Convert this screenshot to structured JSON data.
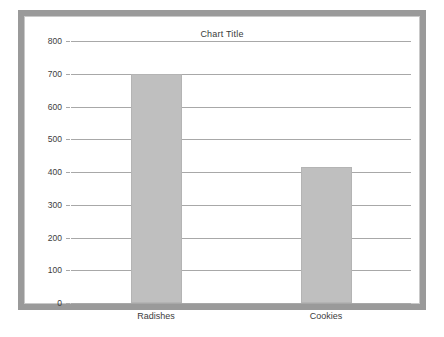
{
  "chart_data": {
    "type": "bar",
    "title": "Chart Title",
    "xlabel": "",
    "ylabel": "",
    "categories": [
      "Radishes",
      "Cookies"
    ],
    "values": [
      700,
      415
    ],
    "ylim": [
      0,
      800
    ],
    "ytick_labels": [
      "800",
      "700",
      "600",
      "500",
      "400",
      "300",
      "200",
      "100",
      "0"
    ],
    "ytick_values": [
      800,
      700,
      600,
      500,
      400,
      300,
      200,
      100,
      0
    ],
    "grid": true,
    "legend": false,
    "series": [
      {
        "name": "Series 1",
        "values": [
          700,
          415
        ]
      }
    ],
    "colors": {
      "bar_fill": "#bfbfbf",
      "bar_border": "#b4b4b4",
      "gridline": "#a8a8a8",
      "frame": "#9a9a9a",
      "inner_border": "#c9c9c9",
      "text": "#3c3c3c",
      "background": "#ffffff"
    }
  }
}
